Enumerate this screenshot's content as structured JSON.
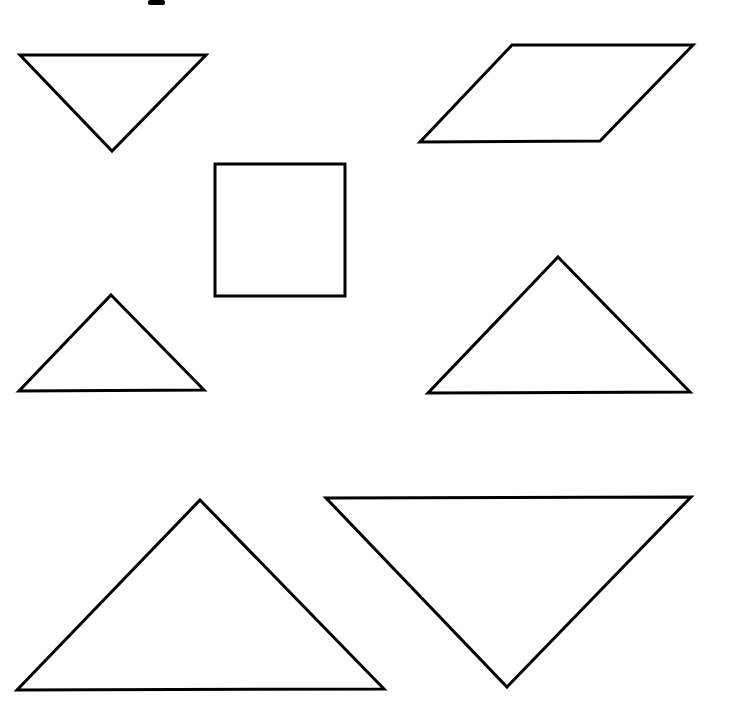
{
  "diagram": {
    "type": "tangram-pieces",
    "canvas": {
      "width": 729,
      "height": 723
    },
    "stroke_color": "#000000",
    "fill_color": "#ffffff",
    "background": "#ffffff",
    "top_fragment": {
      "x": 148,
      "y": 0,
      "width": 17,
      "height": 5
    },
    "pieces": [
      {
        "id": "small-triangle-top-left",
        "kind": "small-triangle",
        "orientation": "point-down",
        "points": [
          [
            20,
            55
          ],
          [
            206,
            55
          ],
          [
            112,
            151
          ]
        ]
      },
      {
        "id": "parallelogram-top-right",
        "kind": "parallelogram",
        "points": [
          [
            512,
            45
          ],
          [
            693,
            45
          ],
          [
            600,
            141
          ],
          [
            420,
            142
          ]
        ]
      },
      {
        "id": "square-center",
        "kind": "square",
        "points": [
          [
            215,
            164
          ],
          [
            345,
            164
          ],
          [
            345,
            296
          ],
          [
            215,
            296
          ]
        ]
      },
      {
        "id": "small-triangle-middle-left",
        "kind": "small-triangle",
        "orientation": "point-up",
        "points": [
          [
            111,
            295
          ],
          [
            204,
            390
          ],
          [
            19,
            391
          ]
        ]
      },
      {
        "id": "medium-triangle-middle-right",
        "kind": "medium-triangle",
        "orientation": "point-up",
        "points": [
          [
            558,
            257
          ],
          [
            690,
            392
          ],
          [
            428,
            393
          ]
        ]
      },
      {
        "id": "large-triangle-bottom-left",
        "kind": "large-triangle",
        "orientation": "point-up",
        "points": [
          [
            200,
            500
          ],
          [
            384,
            689
          ],
          [
            17,
            690
          ]
        ]
      },
      {
        "id": "large-triangle-bottom-right",
        "kind": "large-triangle",
        "orientation": "point-down",
        "points": [
          [
            326,
            498
          ],
          [
            691,
            497
          ],
          [
            507,
            687
          ]
        ]
      }
    ]
  }
}
